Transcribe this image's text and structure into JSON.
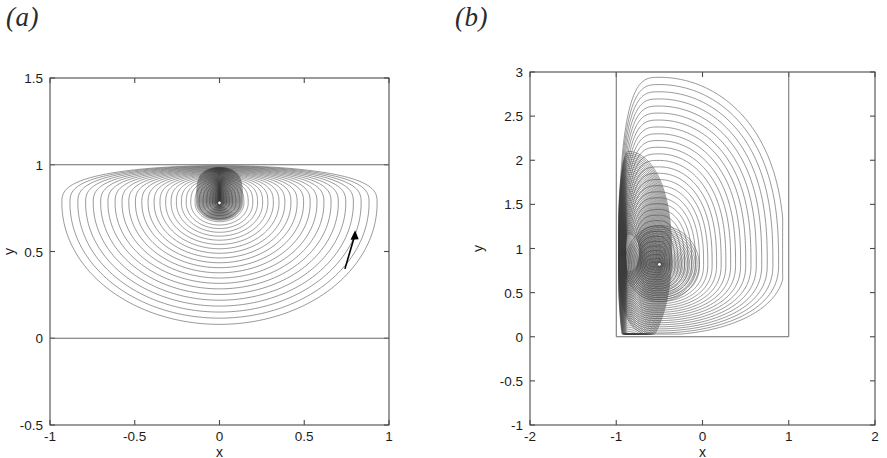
{
  "figure": {
    "background_color": "#ffffff",
    "line_color": "#5a5a5a",
    "axis_color": "#4a4a4a",
    "text_color": "#1c1c1c"
  },
  "panels": [
    {
      "id": "a",
      "label": "(a)",
      "xlabel": "x",
      "ylabel": "y",
      "xticks": [
        "-1",
        "-0.5",
        "0",
        "0.5",
        "1"
      ],
      "xtick_values": [
        -1,
        -0.5,
        0,
        0.5,
        1
      ],
      "yticks": [
        "-0.5",
        "0",
        "0.5",
        "1",
        "1.5"
      ],
      "ytick_values": [
        -0.5,
        0,
        0.5,
        1,
        1.5
      ],
      "xlim": [
        -1,
        1
      ],
      "ylim": [
        -0.5,
        1.5
      ]
    },
    {
      "id": "b",
      "label": "(b)",
      "xlabel": "x",
      "ylabel": "y",
      "xticks": [
        "-2",
        "-1",
        "0",
        "1",
        "2"
      ],
      "xtick_values": [
        -2,
        -1,
        0,
        1,
        2
      ],
      "yticks": [
        "-1",
        "-0.5",
        "0",
        "0.5",
        "1",
        "1.5",
        "2",
        "2.5",
        "3"
      ],
      "ytick_values": [
        -1,
        -0.5,
        0,
        0.5,
        1,
        1.5,
        2,
        2.5,
        3
      ],
      "xlim": [
        -2,
        2
      ],
      "ylim": [
        -1,
        3
      ]
    }
  ],
  "chart_data": [
    {
      "type": "line",
      "panel": "a",
      "title": "(a)",
      "xlabel": "x",
      "ylabel": "y",
      "xlim": [
        -1,
        1
      ],
      "ylim": [
        -0.5,
        1.5
      ],
      "xticks": [
        -1,
        -0.5,
        0,
        0.5,
        1
      ],
      "yticks": [
        -0.5,
        0,
        0.5,
        1,
        1.5
      ],
      "grid": false,
      "legend": "none",
      "description": "Closed streamline contours of a vortex inside a horizontal channel bounded by walls at y=0 and y=1.",
      "series": [
        {
          "name": "channel-wall-lower",
          "kind": "straight-line",
          "y": 0,
          "x_from": -1,
          "x_to": 1
        },
        {
          "name": "channel-wall-upper",
          "kind": "straight-line",
          "y": 1,
          "x_from": -1,
          "x_to": 1
        },
        {
          "name": "streamline-contours",
          "kind": "nested-closed-curves",
          "center": [
            0.0,
            0.78
          ],
          "count": 30,
          "outer_extent_x": [
            -0.93,
            0.93
          ],
          "outer_extent_y": [
            0.08,
            0.99
          ],
          "accumulation": "contours crowd toward the upper wall above the vortex centre"
        }
      ],
      "annotations": [
        {
          "name": "flow-direction-arrow",
          "at": [
            0.74,
            0.52
          ],
          "direction": "up-right",
          "meaning": "counter-clockwise circulation"
        },
        {
          "name": "vortex-centre-marker",
          "at": [
            0.0,
            0.78
          ]
        }
      ]
    },
    {
      "type": "line",
      "panel": "b",
      "title": "(b)",
      "xlabel": "x",
      "ylabel": "y",
      "xlim": [
        -2,
        2
      ],
      "ylim": [
        -1,
        3
      ],
      "xticks": [
        -2,
        -1,
        0,
        1,
        2
      ],
      "yticks": [
        -1,
        -0.5,
        0,
        0.5,
        1,
        1.5,
        2,
        2.5,
        3
      ],
      "grid": false,
      "legend": "none",
      "description": "Closed streamline contours of a vortex in a rectangular cavity with walls at x=-1, x=1 and y=0, open at the top.",
      "series": [
        {
          "name": "cavity-wall-left",
          "kind": "straight-line",
          "x": -1,
          "y_from": 0,
          "y_to": 3
        },
        {
          "name": "cavity-wall-right",
          "kind": "straight-line",
          "x": 1,
          "y_from": 0,
          "y_to": 3
        },
        {
          "name": "cavity-wall-bottom",
          "kind": "straight-line",
          "y": 0,
          "x_from": -1,
          "x_to": 1
        },
        {
          "name": "streamline-contours",
          "kind": "nested-closed-curves",
          "center": [
            -0.5,
            0.82
          ],
          "count": 32,
          "outer_extent_x": [
            -0.97,
            0.92
          ],
          "outer_extent_y": [
            0.03,
            2.93
          ],
          "accumulation": "contours crowd against the left wall near x=-1, y=1"
        }
      ],
      "annotations": [
        {
          "name": "vortex-centre-marker",
          "at": [
            -0.5,
            0.82
          ]
        }
      ]
    }
  ]
}
